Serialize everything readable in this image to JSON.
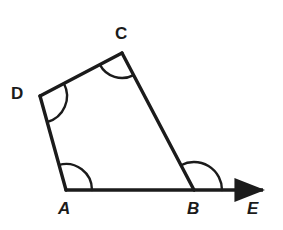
{
  "figure": {
    "name": "quadrilateral-abcd-with-ray-be",
    "background_color": "#ffffff",
    "stroke_color": "#1b1b1b",
    "arc_color": "#1b1b1b",
    "label_color": "#1b1b1b",
    "stroke_width": 3,
    "arc_stroke_width": 2.4,
    "width": 283,
    "height": 230
  },
  "vertices": {
    "A": {
      "label": "A",
      "x": 66,
      "y": 190
    },
    "B": {
      "label": "B",
      "x": 194,
      "y": 190
    },
    "C": {
      "label": "C",
      "x": 122,
      "y": 53
    },
    "D": {
      "label": "D",
      "x": 40,
      "y": 96
    },
    "E": {
      "label": "E",
      "x": 272,
      "y": 190
    }
  },
  "labels": {
    "A": "A",
    "B": "B",
    "C": "C",
    "D": "D",
    "E": "E"
  },
  "segments": [
    {
      "name": "segment-AB",
      "from": "A",
      "to": "B"
    },
    {
      "name": "segment-BC",
      "from": "B",
      "to": "C"
    },
    {
      "name": "segment-CD",
      "from": "C",
      "to": "D"
    },
    {
      "name": "segment-DA",
      "from": "D",
      "to": "A"
    }
  ],
  "rays": [
    {
      "name": "ray-BE",
      "from": "B",
      "to": "E",
      "arrowhead": true
    }
  ],
  "angle_arcs": [
    {
      "name": "angle-arc-A",
      "vertex": "A",
      "radius": 26,
      "between": [
        "D",
        "B"
      ]
    },
    {
      "name": "angle-arc-B",
      "vertex": "B",
      "radius": 28,
      "between": [
        "C",
        "E"
      ]
    },
    {
      "name": "angle-arc-C",
      "vertex": "C",
      "radius": 25,
      "between": [
        "D",
        "B"
      ]
    },
    {
      "name": "angle-arc-D",
      "vertex": "D",
      "radius": 27,
      "between": [
        "C",
        "A"
      ]
    }
  ],
  "chart_data": {
    "type": "diagram",
    "title": "",
    "shape": "quadrilateral",
    "points": {
      "A": [
        66,
        190
      ],
      "B": [
        194,
        190
      ],
      "C": [
        122,
        53
      ],
      "D": [
        40,
        96
      ],
      "E": [
        272,
        190
      ]
    },
    "edges": [
      [
        "A",
        "B"
      ],
      [
        "B",
        "C"
      ],
      [
        "C",
        "D"
      ],
      [
        "D",
        "A"
      ]
    ],
    "ray": [
      "B",
      "E"
    ],
    "marked_angles": [
      "A",
      "B",
      "C",
      "D"
    ]
  }
}
